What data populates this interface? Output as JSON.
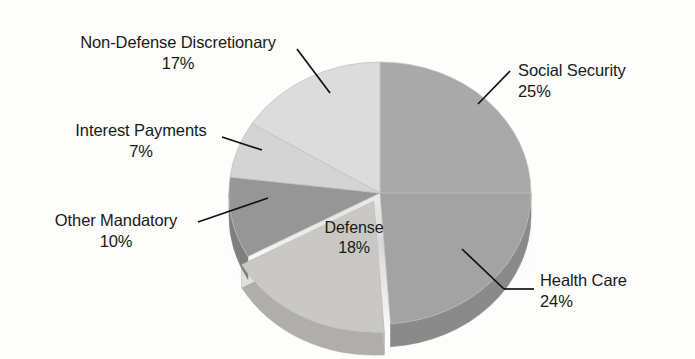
{
  "figure": {
    "type": "pie-chart-3d",
    "background_color": "#fdfdfc",
    "text_color": "#191919"
  },
  "chart_data": {
    "type": "pie",
    "title": "",
    "xlabel": "",
    "ylabel": "",
    "units": "percent",
    "total": 101,
    "legend_position": "none",
    "labels_position": "callout",
    "start_angle_deg": 0,
    "direction": "clockwise",
    "categories": [
      "Social Security",
      "Health Care",
      "Defense",
      "Other Mandatory",
      "Interest Payments",
      "Non-Defense Discretionary"
    ],
    "values": [
      25,
      24,
      18,
      10,
      7,
      17
    ],
    "slices": [
      {
        "name": "Social Security",
        "label": "Social Security",
        "value": 25,
        "pct_text": "25%",
        "color": "#a9a9a9",
        "side_color": "#8f8f8f",
        "start_deg": 0,
        "end_deg": 90,
        "exploded": false,
        "label_side": "right"
      },
      {
        "name": "Health Care",
        "label": "Health Care",
        "value": 24,
        "pct_text": "24%",
        "color": "#a3a3a3",
        "side_color": "#8a8a8a",
        "start_deg": 90,
        "end_deg": 176,
        "exploded": false,
        "label_side": "right"
      },
      {
        "name": "Defense",
        "label": "Defense",
        "value": 18,
        "pct_text": "18%",
        "color": "#cac8c5",
        "side_color": "#b0aeab",
        "start_deg": 176,
        "end_deg": 241,
        "exploded": true,
        "label_side": "inside"
      },
      {
        "name": "Other Mandatory",
        "label": "Other Mandatory",
        "value": 10,
        "pct_text": "10%",
        "color": "#969696",
        "side_color": "#7f7f7f",
        "start_deg": 241,
        "end_deg": 277,
        "exploded": false,
        "label_side": "left"
      },
      {
        "name": "Interest Payments",
        "label": "Interest Payments",
        "value": 7,
        "pct_text": "7%",
        "color": "#d4d4d4",
        "side_color": "#b8b8b8",
        "start_deg": 277,
        "end_deg": 302,
        "exploded": false,
        "label_side": "left"
      },
      {
        "name": "Non-Defense Discretionary",
        "label": "Non-Defense Discretionary",
        "value": 17,
        "pct_text": "17%",
        "color": "#dcdcdc",
        "side_color": "#c0c0c0",
        "start_deg": 302,
        "end_deg": 360,
        "exploded": false,
        "label_side": "left"
      }
    ]
  },
  "labels": {
    "non_defense_discretionary": {
      "name": "Non-Defense Discretionary",
      "pct": "17%"
    },
    "interest_payments": {
      "name": "Interest Payments",
      "pct": "7%"
    },
    "other_mandatory": {
      "name": "Other Mandatory",
      "pct": "10%"
    },
    "defense": {
      "name": "Defense",
      "pct": "18%"
    },
    "social_security": {
      "name": "Social Security",
      "pct": "25%"
    },
    "health_care": {
      "name": "Health Care",
      "pct": "24%"
    }
  }
}
